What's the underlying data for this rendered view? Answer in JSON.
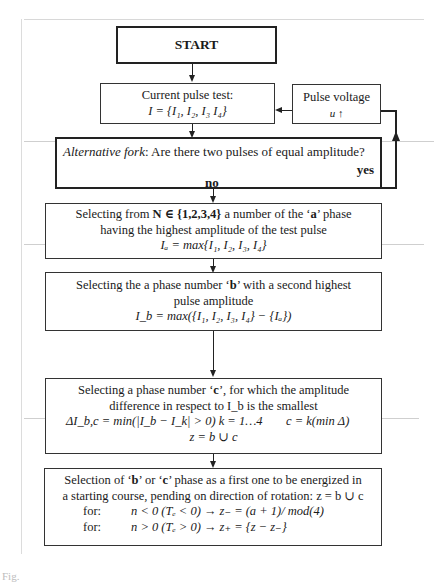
{
  "flowchart": {
    "start": {
      "label": "START"
    },
    "current_pulse_test": {
      "line1": "Current pulse test:",
      "line2": "I = {I₁, I₂, I₃ I₄}"
    },
    "pulse_voltage": {
      "line1": "Pulse voltage",
      "line2": "u ↑"
    },
    "alternative_fork": {
      "prefix": "Alternative fork",
      "question": ":  Are there two pulses of equal amplitude?",
      "yes_label": "yes",
      "no_label": "no"
    },
    "select_a": {
      "line1_pre": "Selecting from ",
      "line1_math": "N ∈ {1,2,3,4}",
      "line1_mid": " a number of the ‘",
      "line1_bold": "a",
      "line1_post": "’ phase",
      "line2": "having the highest amplitude of the test pulse",
      "line3": "Iₐ = max{I₁, I₂, I₃, I₄}"
    },
    "select_b": {
      "line1_pre": "Selecting the a phase number ‘",
      "line1_bold": "b",
      "line1_post": "’ with a second highest",
      "line2": "pulse amplitude",
      "line3": "I_b = max({I₁, I₂, I₃, I₄} − {Iₐ})"
    },
    "select_c": {
      "line1_pre": "Selecting a phase number ‘",
      "line1_bold": "c",
      "line1_post": "’, for which the amplitude",
      "line2": "difference in respect to I_b is the smallest",
      "line3_left": "ΔI_b,c = min(|I_b − I_k| > 0)   k = 1…4",
      "line3_right": "c = k(min Δ)",
      "line4": "z = b ∪ c"
    },
    "selection": {
      "line1_pre": "Selection of ‘",
      "line1_b": "b",
      "line1_mid": "’ or ‘",
      "line1_c": "c",
      "line1_post": "’ phase as a first one to be energized in",
      "line2": "a starting course, pending on direction of rotation:  z = b ∪ c",
      "rows": [
        {
          "label": "for:",
          "expr": "n < 0   (Tₑ < 0) → z₋ = (a + 1)/ mod(4)"
        },
        {
          "label": "for:",
          "expr": "n > 0   (Tₑ > 0) → z₊ = {z − z₋}"
        }
      ]
    }
  },
  "caption": {
    "text": "Fig."
  }
}
